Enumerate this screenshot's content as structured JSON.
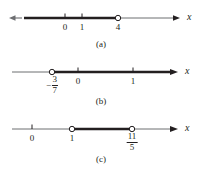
{
  "figure": {
    "axis_variable": "x",
    "colors": {
      "ink": "#231f20",
      "thin_line": "#6d6e71",
      "thick_line": "#231f20",
      "background": "#ffffff"
    },
    "panels": [
      {
        "id": "a",
        "caption": "(a)",
        "axis_label": "x",
        "interval_description": "shaded from left arrow to 4, open at 4",
        "ticks": [
          {
            "label": "0",
            "value": "0"
          },
          {
            "label": "1",
            "value": "1"
          }
        ],
        "endpoints": [
          {
            "label": "4",
            "value": "4",
            "marker": "open-circle"
          }
        ],
        "left_arrow": true,
        "right_arrow": true
      },
      {
        "id": "b",
        "caption": "(b)",
        "axis_label": "x",
        "interval_description": "shaded from -3/7 to right arrow, open at -3/7",
        "ticks": [
          {
            "label": "0",
            "value": "0"
          },
          {
            "label": "1",
            "value": "1"
          }
        ],
        "endpoints": [
          {
            "label": "-3/7",
            "numerator": "3",
            "denominator": "7",
            "sign": "−",
            "marker": "open-circle"
          }
        ],
        "left_arrow": false,
        "right_arrow": true
      },
      {
        "id": "c",
        "caption": "(c)",
        "axis_label": "x",
        "interval_description": "shaded from 1 to 11/5, open at both ends",
        "ticks": [
          {
            "label": "0",
            "value": "0"
          }
        ],
        "endpoints": [
          {
            "label": "1",
            "value": "1",
            "marker": "open-circle"
          },
          {
            "label": "11/5",
            "numerator": "11",
            "denominator": "5",
            "sign": "",
            "marker": "open-circle"
          }
        ],
        "left_arrow": false,
        "right_arrow": true
      }
    ]
  }
}
